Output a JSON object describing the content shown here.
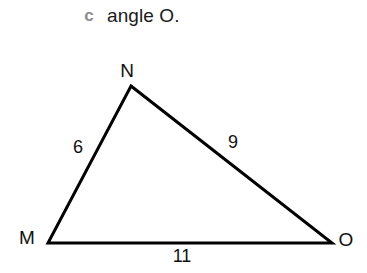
{
  "question": {
    "part_letter": "c",
    "text": "angle O.",
    "part_letter_color": "#8c8c8c",
    "text_color": "#1a1a1a"
  },
  "figure": {
    "type": "triangle",
    "name": "triangle-MNO",
    "stroke_color": "#000000",
    "stroke_width": 3,
    "background_color": "#ffffff",
    "vertices": [
      {
        "label": "N",
        "x": 131,
        "y": 86,
        "label_x": 127,
        "label_y": 71
      },
      {
        "label": "M",
        "x": 48,
        "y": 243,
        "label_x": 27,
        "label_y": 238
      },
      {
        "label": "O",
        "x": 332,
        "y": 243,
        "label_x": 346,
        "label_y": 240
      }
    ],
    "sides": [
      {
        "name": "MN",
        "from": "M",
        "to": "N",
        "length_label": "6",
        "label_x": 78,
        "label_y": 147
      },
      {
        "name": "NO",
        "from": "N",
        "to": "O",
        "length_label": "9",
        "label_x": 233,
        "label_y": 142
      },
      {
        "name": "MO",
        "from": "M",
        "to": "O",
        "length_label": "11",
        "label_x": 182,
        "label_y": 256
      }
    ],
    "polygon_points": "131,86 332,243 48,243"
  }
}
